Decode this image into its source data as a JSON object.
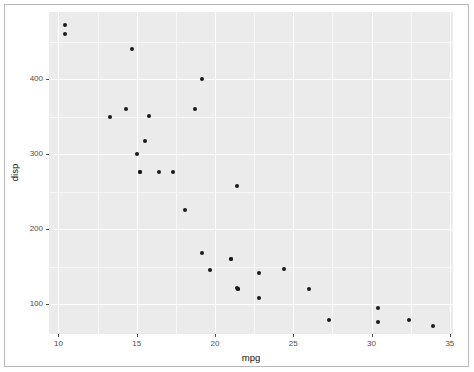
{
  "figure": {
    "kind": "scatter-plot",
    "background_color": "#ffffff",
    "panel_color": "#ebebeb",
    "grid_color": "#ffffff",
    "point_color": "#1a1a1a",
    "axis_text_color": "#4d4d4d",
    "frame_color": "#b9b9b9"
  },
  "chart_data": {
    "type": "scatter",
    "title": "",
    "subtitle": "",
    "xlabel": "mpg",
    "ylabel": "disp",
    "xlim": [
      9.4,
      35.2
    ],
    "ylim": [
      60.0,
      490.0
    ],
    "xticks": [
      10,
      15,
      20,
      25,
      30,
      35
    ],
    "xticklabels": [
      "10",
      "15",
      "20",
      "25",
      "30",
      "35"
    ],
    "yticks": [
      100,
      200,
      300,
      400
    ],
    "yticklabels": [
      "100",
      "200",
      "300",
      "400"
    ],
    "grid": true,
    "minor_grid": true,
    "minor_xticks": [
      12.5,
      17.5,
      22.5,
      27.5,
      32.5
    ],
    "minor_yticks": [
      150,
      250,
      350,
      450
    ],
    "legend": null,
    "legend_position": "none",
    "annotations": [],
    "series": [
      {
        "name": "mtcars",
        "marker": "filled-circle",
        "marker_size": 4,
        "color": "#1a1a1a",
        "x": [
          10.4,
          10.4,
          14.7,
          13.3,
          14.3,
          15.8,
          15.0,
          19.2,
          18.7,
          15.2,
          15.2,
          15.5,
          16.4,
          17.3,
          21.4,
          18.1,
          19.7,
          21.5,
          22.8,
          21.0,
          21.0,
          24.4,
          22.8,
          19.2,
          26.0,
          21.4,
          30.4,
          27.3,
          30.4,
          32.4,
          33.9,
          21.5
        ],
        "y": [
          472.0,
          460.0,
          440.0,
          350.0,
          360.0,
          351.0,
          301.0,
          400.0,
          360.0,
          275.8,
          275.8,
          318.0,
          275.8,
          275.8,
          258.0,
          225.0,
          145.0,
          120.1,
          140.8,
          160.0,
          160.0,
          146.7,
          108.0,
          167.6,
          120.3,
          121.0,
          95.1,
          79.0,
          75.7,
          78.7,
          71.1,
          120.1
        ],
        "xlabel_name": "mpg",
        "ylabel_name": "disp"
      }
    ]
  },
  "axis": {
    "x_title": "mpg",
    "y_title": "disp"
  }
}
